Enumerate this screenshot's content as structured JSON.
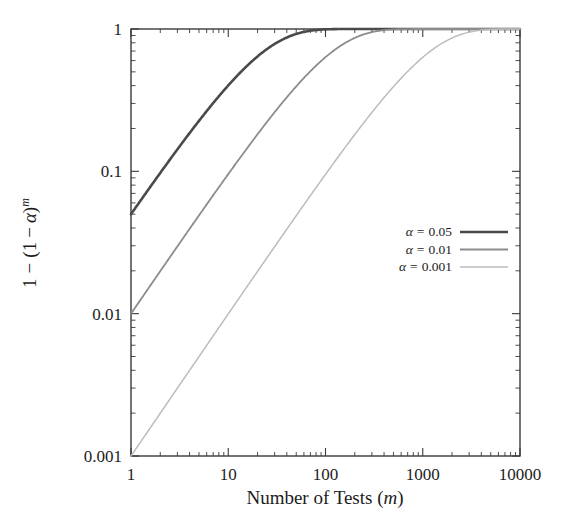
{
  "chart_data": {
    "type": "line",
    "title": "",
    "xlabel": "Number of Tests (m)",
    "ylabel": "1 − (1 − α)^m",
    "xscale": "log",
    "yscale": "log",
    "xlim": [
      1,
      10000
    ],
    "ylim": [
      0.001,
      1
    ],
    "grid": false,
    "legend_position": "center-right",
    "xticklabels": [
      "1",
      "10",
      "100",
      "1000",
      "10000"
    ],
    "xtickvalues": [
      1,
      10,
      100,
      1000,
      10000
    ],
    "yticklabels": [
      "1",
      "0.1",
      "0.01",
      "0.001"
    ],
    "ytickvalues": [
      1,
      0.1,
      0.01,
      0.001
    ],
    "series": [
      {
        "name": "α = 0.05",
        "alpha": 0.05,
        "color": "#4a4a4a",
        "linewidth": 2.6,
        "x": [
          1,
          2,
          3,
          5,
          7,
          10,
          15,
          20,
          30,
          50,
          70,
          100,
          150,
          200,
          300,
          500,
          700,
          1000,
          2000,
          5000,
          10000
        ],
        "y": [
          0.05,
          0.0975,
          0.142625,
          0.2262,
          0.30166,
          0.401263,
          0.536702,
          0.641514,
          0.785361,
          0.923055,
          0.972558,
          0.994079,
          0.999546,
          0.999965,
          1.0,
          1.0,
          1.0,
          1.0,
          1.0,
          1.0,
          1.0
        ]
      },
      {
        "name": "α = 0.01",
        "alpha": 0.01,
        "color": "#8c8c8c",
        "linewidth": 1.8,
        "x": [
          1,
          2,
          3,
          5,
          7,
          10,
          15,
          20,
          30,
          50,
          70,
          100,
          150,
          200,
          300,
          500,
          700,
          1000,
          2000,
          5000,
          10000
        ],
        "y": [
          0.01,
          0.0199,
          0.029701,
          0.04901,
          0.067934,
          0.095618,
          0.139944,
          0.182093,
          0.260301,
          0.394994,
          0.505255,
          0.633968,
          0.778289,
          0.866602,
          0.950925,
          0.993431,
          0.999093,
          0.99996,
          1.0,
          1.0,
          1.0
        ]
      },
      {
        "name": "α = 0.001",
        "alpha": 0.001,
        "color": "#bcbcbc",
        "linewidth": 1.5,
        "x": [
          1,
          2,
          3,
          5,
          7,
          10,
          15,
          20,
          30,
          50,
          70,
          100,
          150,
          200,
          300,
          500,
          700,
          1000,
          1500,
          2000,
          3000,
          5000,
          7000,
          10000
        ],
        "y": [
          0.001,
          0.001999,
          0.002997,
          0.00499,
          0.006979,
          0.009955,
          0.014896,
          0.019812,
          0.029562,
          0.048771,
          0.067611,
          0.095208,
          0.139404,
          0.181433,
          0.259316,
          0.393628,
          0.503546,
          0.632305,
          0.777305,
          0.864665,
          0.950305,
          0.993261,
          0.999087,
          0.999955
        ]
      }
    ]
  },
  "axes": {
    "x_title_prefix": "Number of Tests (",
    "x_title_var": "m",
    "x_title_suffix": ")",
    "y_title_parts": {
      "one": "1",
      "minus1": "−",
      "open": "(",
      "one2": "1",
      "minus2": "−",
      "alpha": "α",
      "close": ")",
      "exp": "m"
    }
  },
  "legend": {
    "items": [
      {
        "label_prefix": "α",
        "label_eq": "=",
        "label_value": "0.05",
        "color": "#4a4a4a"
      },
      {
        "label_prefix": "α",
        "label_eq": "=",
        "label_value": "0.01",
        "color": "#8c8c8c"
      },
      {
        "label_prefix": "α",
        "label_eq": "=",
        "label_value": "0.001",
        "color": "#bcbcbc"
      }
    ]
  }
}
